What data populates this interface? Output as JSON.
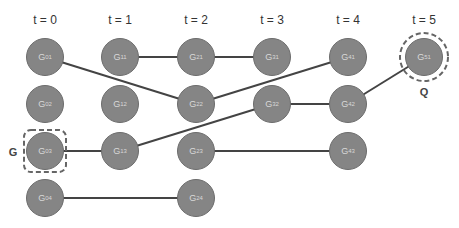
{
  "diagram": {
    "time_steps": [
      {
        "label": "t = 0",
        "x": 45
      },
      {
        "label": "t = 1",
        "x": 120
      },
      {
        "label": "t = 2",
        "x": 196
      },
      {
        "label": "t = 3",
        "x": 272
      },
      {
        "label": "t = 4",
        "x": 348
      },
      {
        "label": "t = 5",
        "x": 424
      }
    ],
    "nodes": [
      {
        "id": "G01",
        "base": "G",
        "sub": "01",
        "x": 45,
        "y": 57
      },
      {
        "id": "G02",
        "base": "G",
        "sub": "02",
        "x": 45,
        "y": 104
      },
      {
        "id": "G03",
        "base": "G",
        "sub": "03",
        "x": 45,
        "y": 151
      },
      {
        "id": "G04",
        "base": "G",
        "sub": "04",
        "x": 45,
        "y": 198
      },
      {
        "id": "G11",
        "base": "G",
        "sub": "11",
        "x": 120,
        "y": 57
      },
      {
        "id": "G12",
        "base": "G",
        "sub": "12",
        "x": 120,
        "y": 104
      },
      {
        "id": "G13",
        "base": "G",
        "sub": "13",
        "x": 120,
        "y": 151
      },
      {
        "id": "G21",
        "base": "G",
        "sub": "21",
        "x": 196,
        "y": 57
      },
      {
        "id": "G22",
        "base": "G",
        "sub": "22",
        "x": 196,
        "y": 104
      },
      {
        "id": "G23",
        "base": "G",
        "sub": "23",
        "x": 196,
        "y": 151
      },
      {
        "id": "G24",
        "base": "G",
        "sub": "24",
        "x": 196,
        "y": 198
      },
      {
        "id": "G31",
        "base": "G",
        "sub": "31",
        "x": 272,
        "y": 57
      },
      {
        "id": "G32",
        "base": "G",
        "sub": "32",
        "x": 272,
        "y": 104
      },
      {
        "id": "G41",
        "base": "G",
        "sub": "41",
        "x": 348,
        "y": 57
      },
      {
        "id": "G42",
        "base": "G",
        "sub": "42",
        "x": 348,
        "y": 104
      },
      {
        "id": "G43",
        "base": "G",
        "sub": "43",
        "x": 348,
        "y": 151
      },
      {
        "id": "G51",
        "base": "G",
        "sub": "51",
        "x": 424,
        "y": 57
      }
    ],
    "edges": [
      [
        "G01",
        "G22"
      ],
      [
        "G11",
        "G21"
      ],
      [
        "G21",
        "G31"
      ],
      [
        "G22",
        "G41"
      ],
      [
        "G03",
        "G13"
      ],
      [
        "G13",
        "G32"
      ],
      [
        "G32",
        "G42"
      ],
      [
        "G42",
        "G51"
      ],
      [
        "G23",
        "G43"
      ],
      [
        "G04",
        "G24"
      ]
    ],
    "markers": {
      "g_label": "G",
      "q_label": "Q"
    },
    "colors": {
      "node_fill": "#858585",
      "node_border": "#6c6c6c",
      "edge": "#444444",
      "dash": "#666666"
    }
  }
}
